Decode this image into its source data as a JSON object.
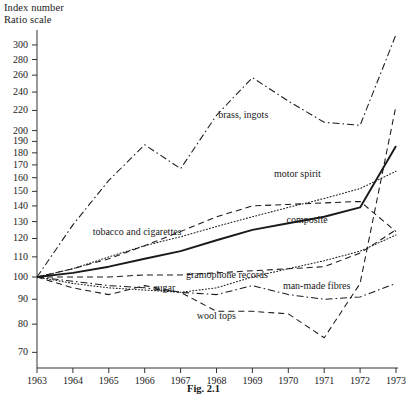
{
  "figure": {
    "caption": "Fig. 2.1",
    "axis_title_line1": "Index number",
    "axis_title_line2": "Ratio scale"
  },
  "chart_data": {
    "type": "line",
    "title": "",
    "subtitle": "",
    "xlabel": "",
    "ylabel": "Index number (Ratio scale)",
    "scale": "log",
    "grid": false,
    "legend": "inline-labels",
    "xlim": [
      1963,
      1973
    ],
    "ylim": [
      65,
      310
    ],
    "x": [
      1963,
      1964,
      1965,
      1966,
      1967,
      1968,
      1969,
      1970,
      1971,
      1972,
      1973
    ],
    "xticklabels": [
      "1963",
      "1964",
      "1965",
      "1966",
      "1967",
      "1968",
      "1969",
      "1970",
      "1971",
      "1972",
      "1973"
    ],
    "yticks": [
      70,
      80,
      90,
      100,
      110,
      120,
      130,
      140,
      150,
      160,
      170,
      180,
      190,
      200,
      220,
      240,
      260,
      280,
      300
    ],
    "yticklabels": [
      "70",
      "80",
      "90",
      "100",
      "110",
      "120",
      "130",
      "140",
      "150",
      "160",
      "170",
      "180",
      "190",
      "200",
      "220",
      "240",
      "260",
      "280",
      "300"
    ],
    "series": [
      {
        "name": "brass, ingots",
        "style": "dash-dot",
        "label_x": 1968.05,
        "label_y": 215,
        "values": [
          100,
          128,
          158,
          187,
          167,
          215,
          257,
          230,
          208,
          205,
          315
        ]
      },
      {
        "name": "motor spirit",
        "style": "dotted",
        "label_x": 1969.6,
        "label_y": 163,
        "values": [
          100,
          104,
          110,
          116,
          121,
          127,
          133,
          139,
          145,
          152,
          165
        ]
      },
      {
        "name": "tobacco and cigarettes",
        "style": "dashed",
        "label_x": 1964.55,
        "label_y": 124,
        "values": [
          100,
          104,
          109,
          116,
          124,
          133,
          140,
          141,
          142,
          143,
          124
        ]
      },
      {
        "name": "composite",
        "style": "solid",
        "label_x": 1969.95,
        "label_y": 131,
        "values": [
          100,
          102,
          105,
          109,
          113,
          119,
          125,
          129,
          133,
          139,
          186
        ]
      },
      {
        "name": "gramophone records",
        "style": "dashed",
        "label_x": 1967.15,
        "label_y": 101,
        "values": [
          100,
          100,
          100,
          101,
          101,
          102,
          103,
          104,
          105,
          112,
          125
        ]
      },
      {
        "name": "sugar",
        "style": "dotted",
        "label_x": 1966.25,
        "label_y": 95,
        "values": [
          100,
          97,
          95,
          94,
          93,
          95,
          100,
          104,
          108,
          113,
          122
        ]
      },
      {
        "name": "man-made fibres",
        "style": "dash-dot",
        "label_x": 1969.85,
        "label_y": 96,
        "values": [
          100,
          98,
          96,
          95,
          93,
          92,
          96,
          92,
          90,
          91,
          97
        ]
      },
      {
        "name": "wool tops",
        "style": "dashed",
        "label_x": 1967.45,
        "label_y": 83,
        "values": [
          100,
          95,
          92,
          96,
          93,
          85,
          85,
          84,
          75,
          97,
          225
        ]
      }
    ]
  }
}
